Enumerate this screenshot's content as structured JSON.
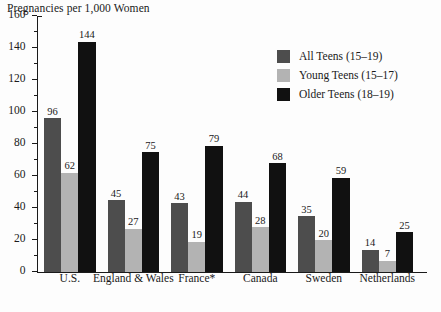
{
  "chart": {
    "title": "Pregnancies per 1,000 Women"
  },
  "legend": {
    "position": "top-right",
    "items": [
      {
        "label": "All Teens (15–19)",
        "color": "#4d4d4d",
        "key": "all-teens"
      },
      {
        "label": "Young Teens (15–17)",
        "color": "#b3b3b3",
        "key": "young-teens"
      },
      {
        "label": "Older Teens (18–19)",
        "color": "#111111",
        "key": "older-teens"
      }
    ]
  },
  "yaxis": {
    "ticks": [
      "0",
      "20",
      "40",
      "60",
      "80",
      "100",
      "120",
      "140",
      "160"
    ],
    "min": 0,
    "max": 160,
    "major_step": 20,
    "minor_step": 10
  },
  "chart_data": {
    "type": "bar",
    "title": "Pregnancies per 1,000 Women",
    "xlabel": "",
    "ylabel": "Pregnancies per 1,000 Women",
    "ylim": [
      0,
      160
    ],
    "grid": false,
    "legend_position": "top-right",
    "categories": [
      "U.S.",
      "England & Wales",
      "France*",
      "Canada",
      "Sweden",
      "Netherlands"
    ],
    "series": [
      {
        "name": "All Teens (15–19)",
        "color": "#4d4d4d",
        "values": [
          96,
          45,
          43,
          44,
          35,
          14
        ]
      },
      {
        "name": "Young Teens (15–17)",
        "color": "#b3b3b3",
        "values": [
          62,
          27,
          19,
          28,
          20,
          7
        ]
      },
      {
        "name": "Older Teens (18–19)",
        "color": "#111111",
        "values": [
          144,
          75,
          79,
          68,
          59,
          25
        ]
      }
    ],
    "note": "France* is marked with an asterisk in the source figure"
  }
}
